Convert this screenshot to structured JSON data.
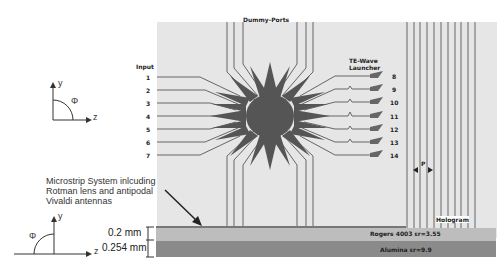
{
  "labels": {
    "dummy_ports": "Dummy-Ports",
    "input": "Input",
    "launcher_line1": "TE-Wave",
    "launcher_line2": "Launcher",
    "period": "P",
    "hologram": "Hologram",
    "rogers": "Rogers 4003 εr=3.55",
    "alumina": "Alumina εr=9.9",
    "dim_top": "0.2 mm",
    "dim_bottom": "0.254 mm",
    "note_line1": "Microstrip System inlcuding",
    "note_line2": "Rotman lens and antipodal",
    "note_line3": "Vivaldi antennas"
  },
  "input_ports": [
    "1",
    "2",
    "3",
    "4",
    "5",
    "6",
    "7"
  ],
  "output_ports": [
    "8",
    "9",
    "10",
    "11",
    "12",
    "13",
    "14"
  ],
  "axes_top": {
    "y": "y",
    "z": "z",
    "angle": "Φ"
  },
  "axes_bottom": {
    "y": "y",
    "z": "z",
    "angle": "Φ"
  },
  "colors": {
    "board": "#e6e6e6",
    "lens": "#555555",
    "trace": "#666666",
    "rogers": "#bdbdbd",
    "alumina": "#8a8a8a"
  }
}
